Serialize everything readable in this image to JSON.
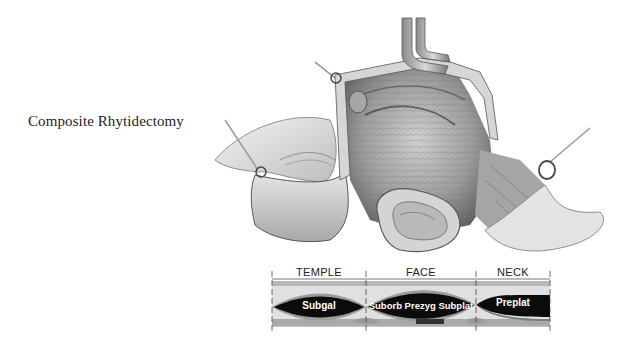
{
  "title": "Composite Rhytidectomy",
  "illustration": {
    "subject": "surgical-illustration-facelift-flap",
    "description": "Grayscale surgical illustration of composite facelift with retracted skin flaps, hooks and ear"
  },
  "legend": {
    "segments": [
      {
        "label": "TEMPLE",
        "layer": "Subgal"
      },
      {
        "label": "FACE",
        "layer": "Suborb Prezyg Subplat"
      },
      {
        "label": "NECK",
        "layer": "Preplat"
      }
    ],
    "colors": {
      "band_top": "#b9b9b9",
      "band_light": "#e2e2e2",
      "layer_dark": "#0a0a0a",
      "band_mid": "#9a9a9a",
      "tick": "#444444"
    }
  }
}
